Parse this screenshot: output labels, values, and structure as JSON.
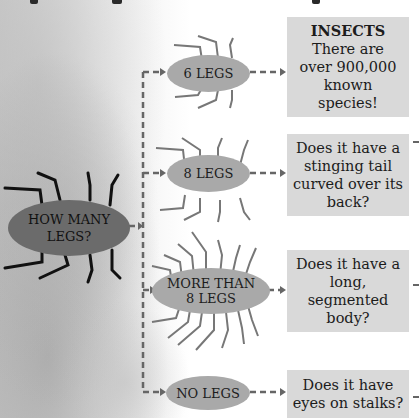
{
  "diagram": {
    "type": "flowchart",
    "root": {
      "label": "HOW MANY LEGS?"
    },
    "branches": [
      {
        "label": "6 LEGS",
        "result_title": "INSECTS",
        "result_text": "There are over 900,000 known species!"
      },
      {
        "label": "8 LEGS",
        "result_title": "",
        "result_text": "Does it have a stinging tail curved over its back?"
      },
      {
        "label": "MORE THAN 8 LEGS",
        "result_title": "",
        "result_text": "Does it have a long, segmented body?"
      },
      {
        "label": "NO LEGS",
        "result_title": "",
        "result_text": "Does it have eyes on stalks?"
      }
    ],
    "colors": {
      "root_fill": "#6b6b6b",
      "branch_fill": "#a9a9a9",
      "box_fill": "#d9d9d9",
      "connector": "#666666"
    }
  },
  "root": {
    "line1": "HOW MANY",
    "line2": "LEGS?"
  },
  "b6": {
    "label": "6 LEGS",
    "title": "INSECTS",
    "l1": "There are",
    "l2": "over 900,000",
    "l3": "known",
    "l4": "species!"
  },
  "b8": {
    "label": "8 LEGS",
    "l1": "Does it have a",
    "l2": "stinging tail",
    "l3": "curved over its",
    "l4": "back?"
  },
  "bmore": {
    "line1": "MORE THAN",
    "line2": "8 LEGS",
    "l1": "Does it have a",
    "l2": "long,",
    "l3": "segmented",
    "l4": "body?"
  },
  "bnone": {
    "label": "NO LEGS",
    "l1": "Does it have",
    "l2": "eyes on stalks?"
  }
}
